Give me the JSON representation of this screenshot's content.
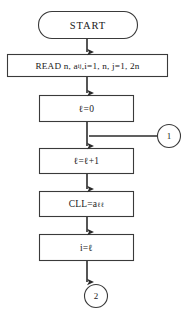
{
  "diagram": {
    "type": "program-flowchart",
    "stroke_color": "#3a3a3a",
    "text_color": "#1a1a1a",
    "background_color": "#ffffff"
  },
  "nodes": {
    "start": {
      "shape": "terminator",
      "label": "START"
    },
    "read": {
      "shape": "process",
      "label": "READ n, a",
      "label_sub": "ij",
      "label_tail": ",i=1, n, j=1, 2n",
      "full_text": "READ n, a_ij, i=1, n, j=1, 2n"
    },
    "init_l": {
      "shape": "process",
      "label": "ℓ=0"
    },
    "increment_l": {
      "shape": "process",
      "label": "ℓ=ℓ+1"
    },
    "assign_cll": {
      "shape": "process",
      "label": "CLL=a",
      "label_sub": "ℓℓ",
      "full_text": "CLL=a_ℓℓ"
    },
    "assign_i": {
      "shape": "process",
      "label": "i=ℓ"
    },
    "connector_in": {
      "shape": "connector",
      "label": "1"
    },
    "connector_out": {
      "shape": "connector",
      "label": "2"
    }
  },
  "edges": [
    {
      "from": "start",
      "to": "read",
      "style": "arrow-down"
    },
    {
      "from": "read",
      "to": "init_l",
      "style": "arrow-down"
    },
    {
      "from": "init_l",
      "to": "increment_l",
      "style": "arrow-down"
    },
    {
      "from": "connector_in",
      "to": "increment_l",
      "style": "arrow-left-then-down"
    },
    {
      "from": "increment_l",
      "to": "assign_cll",
      "style": "arrow-down"
    },
    {
      "from": "assign_cll",
      "to": "assign_i",
      "style": "arrow-down"
    },
    {
      "from": "assign_i",
      "to": "connector_out",
      "style": "arrow-down"
    }
  ]
}
